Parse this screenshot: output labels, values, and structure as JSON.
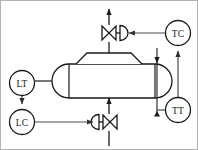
{
  "diagram": {
    "type": "piping-and-instrumentation-diagram",
    "background_color": "#ffffff",
    "line_color": "#1a1a1a",
    "signal_color": "#444444",
    "border_color": "#b0b0b0"
  },
  "instruments": [
    {
      "id": "TC",
      "tag": "TC",
      "name": "temperature-controller",
      "shape": "circle",
      "cx": 178,
      "cy": 33,
      "r": 12.5
    },
    {
      "id": "TT",
      "tag": "TT",
      "name": "temperature-transmitter",
      "shape": "circle",
      "cx": 178,
      "cy": 110,
      "r": 12.5
    },
    {
      "id": "LT",
      "tag": "LT",
      "name": "level-transmitter",
      "shape": "circle",
      "cx": 22,
      "cy": 83,
      "r": 12.5
    },
    {
      "id": "LC",
      "tag": "LC",
      "name": "level-controller",
      "shape": "circle",
      "cx": 22,
      "cy": 122,
      "r": 12.5
    }
  ],
  "equipment": {
    "vessel": {
      "name": "horizontal-vessel",
      "x": 52,
      "y": 64,
      "width": 120,
      "height": 34,
      "head_style": "elliptical"
    },
    "dome": {
      "name": "vapor-dome",
      "top_left_x": 85,
      "top_right_x": 133,
      "base_left_x": 75,
      "base_right_x": 143,
      "top_y": 53,
      "base_y": 64
    }
  },
  "valves": [
    {
      "id": "top-valve",
      "name": "vapor-outlet-control-valve",
      "cx": 110,
      "cy": 33,
      "actuator_side": "right",
      "body": "globe-control-valve"
    },
    {
      "id": "bottom-valve",
      "name": "liquid-outlet-control-valve",
      "cx": 110,
      "cy": 122,
      "actuator_side": "left",
      "body": "globe-control-valve"
    }
  ],
  "process_lines": [
    {
      "name": "vapor-outlet-line",
      "from": "dome-top",
      "to": "top-arrow",
      "direction": "up"
    },
    {
      "name": "liquid-inlet-line",
      "from": "bottom-arrow",
      "to": "vessel-bottom",
      "direction": "up"
    },
    {
      "name": "level-tap-line",
      "from": "vessel-left-head",
      "to": "LT",
      "direction": "left"
    }
  ],
  "signal_lines": [
    {
      "name": "tc-to-valve-signal",
      "from": "TC",
      "to": "top-valve-actuator",
      "direction": "left"
    },
    {
      "name": "tt-to-tc-signal",
      "from": "TT",
      "to": "TC",
      "direction": "up"
    },
    {
      "name": "lt-to-lc-signal",
      "from": "LT",
      "to": "LC",
      "direction": "down"
    },
    {
      "name": "lc-to-valve-signal",
      "from": "LC",
      "to": "bottom-valve-actuator",
      "direction": "right"
    }
  ],
  "internal": {
    "thermowell": {
      "name": "internal-thermowell-span",
      "x": 157,
      "y_top": 55,
      "y_bottom": 115
    },
    "baffle": {
      "name": "internal-baffle-line",
      "x": 70,
      "y_top": 64,
      "y_bottom": 98
    }
  }
}
